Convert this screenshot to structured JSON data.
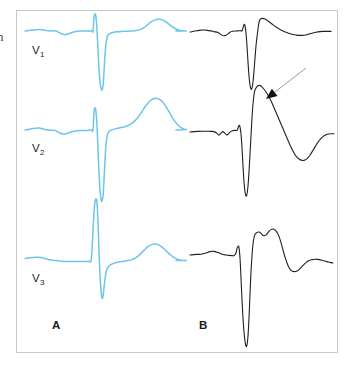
{
  "figure": {
    "type": "ecg-strip-comparison",
    "background_color": "#ffffff",
    "frame_color": "#c9c9c9",
    "margin_fragment_text": "n"
  },
  "panels": [
    {
      "id": "panel-a",
      "label": "A",
      "trace_color": "#6dc5e8",
      "leads": [
        {
          "label_text": "V",
          "label_sub": "1",
          "name": "V1"
        },
        {
          "label_text": "V",
          "label_sub": "2",
          "name": "V2"
        },
        {
          "label_text": "V",
          "label_sub": "3",
          "name": "V3"
        }
      ]
    },
    {
      "id": "panel-b",
      "label": "B",
      "trace_color": "#231f20",
      "annotation": {
        "type": "arrow",
        "color": "#9a9a9a",
        "head_color": "#111111",
        "from_x": 306,
        "from_y": 68,
        "to_x": 266,
        "to_y": 99
      }
    }
  ],
  "chart_data": {
    "type": "line",
    "title": "",
    "xlabel": "",
    "ylabel": "",
    "grid": false,
    "legend": "none",
    "series": [
      {
        "name": "A-V1",
        "color": "#6dc5e8",
        "baseline_y": 31,
        "points": "25,31 34,30 40,29.5 46,30.5 52,31 56,31 60,33 64,34.5 68,34 72,32.5 76,31.5 80,31 84,31 88,31 90,31 92,30.8 93,31 94,18 95,14 96,17 97,30 98,50 99,68 100,82 101,88 102,90 103,86 104,72 105,55 106,44 107,38 108,35 110,33.5 113,32.5 117,31.8 121,31.4 126,31.2 131,31 136,30.6 140,29.6 144,27.6 148,24.4 152,21.4 156,19.6 160,19.2 164,20.6 168,23.4 172,26.6 176,29 180,30.4 183,30.9 186,31 176,31"
      },
      {
        "name": "A-V2",
        "color": "#6dc5e8",
        "baseline_y": 130,
        "points": "25,130 33,128.6 39,128 45,129.4 51,130.2 55,130.4 59,132.6 63,134 67,133.6 71,132 75,131 79,130.6 84,130.4 88,130.4 90,130.2 92,130 93,130 94,113 95,108 96,112 97,126 98,150 99,172 100,190 101,199 102,201 103,196 104,180 105,160 106,145 107,137 108,133 110,130.6 113,129.4 117,128.4 121,127.6 125,126.6 129,125 133,122.4 137,118.4 141,113 145,107 149,102 153,99 157,98.4 161,100.4 165,105 169,111.6 173,118.6 177,124 181,127.6 184,129.2 186,129.6 176,130"
      },
      {
        "name": "A-V3",
        "color": "#6dc5e8",
        "baseline_y": 260,
        "points": "25,258.4 33,257.6 39,257.2 45,258.6 51,260 56,260.6 61,261.2 66,261.4 72,261.4 78,261.4 83,261.4 87,261.4 89,261.2 91,261 92,250 93,230 94,212 95,202 96,199 97,203 98,222 99,250 100,275 101,290 102,298 103,296 104,288 105,279 106,273 107,269 109,266 112,264 116,262.6 120,261.8 124,261.2 128,260.6 132,259.6 136,257.6 140,254.4 144,250.4 148,246.6 152,244.4 156,244 160,245.6 164,248.8 168,252.6 172,256 176,258.6 180,260 183,260.4 186,260.6 176,260.6"
      },
      {
        "name": "B-1",
        "color": "#231f20",
        "baseline_y": 32,
        "points": "190,32 197,30.8 203,30 209,30.6 214,31.6 218,32.6 221,34.6 224,35.8 227,34.6 230,32.2 233,31.2 236,31 239,30.8 241,30.6 242,31 243,28 244,24.6 245,26 246,33 247,46 248,62 249,76 250,85 251,89 252,88 253,82 254,71 255,58 256,46 257,37 258,29 259,22.6 260,19.6 262,18.4 265,19 268,21 272,24 276,27 280,29.4 284,31.4 288,33 292,34.2 296,35 300,35.4 304,35.2 308,34.4 312,33.2 316,32.2 320,31.6 324,31.4 328,31.4 331,31.4"
      },
      {
        "name": "B-2",
        "color": "#231f20",
        "baseline_y": 132,
        "points": "190,132 197,131.4 204,131.2 210,131.4 214,131.6 217,133.4 219,135 221,133.2 223,131.6 225,133.4 227,135 229,133.2 231,131.4 233,130.6 235,130.4 237,130.4 238,128 239,125.4 240,127 241,134 242,148 243,166 244,182 245,192 246,196 247,194 248,186 249,172 250,154 251,136 252,118 253,104 254,95 255,90 257,86.6 259,85.4 261,86 263,88 266,92 269,97 272,103 275,110 278,117 281,124 284,131 287,138 290,145 293,151 296,156 299,159 302,160.4 305,160 308,157.6 311,153.6 314,148.6 317,143.6 320,139.6 323,136.6 326,134.8 329,134 332,133.8 334,133.8"
      },
      {
        "name": "B-3",
        "color": "#231f20",
        "baseline_y": 255,
        "points": "190,255 196,254.4 201,254.2 206,253 210,251.6 214,251.4 218,252.6 222,254.2 226,255 229,255.4 232,255.6 234,255.6 236,253 237,248.6 238,246.4 239,247.6 240,258 241,278 242,300 243,318 244,332 245,341 246,346 247,345 248,336 249,318 250,294 251,272 252,256 253,244 254,238 255,234.4 257,232.4 259,232 261,233.4 263,235.4 265,235.6 267,234 269,231.4 271,229.6 273,229 275,229.8 277,232.4 279,236.4 281,242.6 283,250 285,257 287,263 289,267.6 291,270.4 294,271.6 297,271 300,268.6 303,265.4 306,262.6 309,260.6 312,259.6 315,259.2 318,259.4 321,260 324,260.8 327,261.6 330,262.4 333,263"
      }
    ],
    "annotations": [
      {
        "text": "V",
        "sub": "1",
        "x": 32,
        "y": 44
      },
      {
        "text": "V",
        "sub": "2",
        "x": 32,
        "y": 142
      },
      {
        "text": "V",
        "sub": "3",
        "x": 32,
        "y": 272
      },
      {
        "text": "A",
        "x": 52,
        "y": 319
      },
      {
        "text": "B",
        "x": 199,
        "y": 319
      }
    ]
  }
}
